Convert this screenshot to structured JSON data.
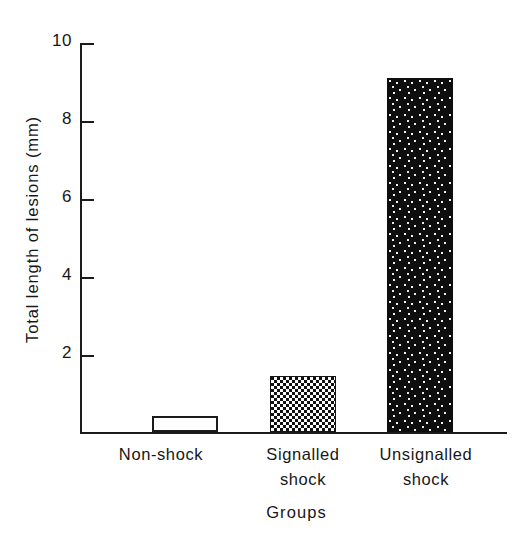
{
  "chart_data": {
    "type": "bar",
    "title": "",
    "subtitle": "",
    "xlabel": "Groups",
    "ylabel": "Total length of lesions (mm)",
    "categories": [
      "Non-shock",
      "Signalled shock",
      "Unsignalled shock"
    ],
    "category_lines": [
      [
        "Non-shock"
      ],
      [
        "Signalled",
        "shock"
      ],
      [
        "Unsignalled",
        "shock"
      ]
    ],
    "values": [
      0.4,
      1.45,
      9.1
    ],
    "ylim": [
      0,
      10
    ],
    "yticks": [
      2,
      4,
      6,
      8,
      10
    ],
    "ytick_labels": [
      "2",
      "4",
      "6",
      "8",
      "10"
    ],
    "grid": false,
    "legend": "none",
    "bar_fills": [
      "open-white",
      "checkerboard",
      "black-speckled"
    ],
    "bars": [
      {
        "label": "Non-shock",
        "value": 0.4,
        "fill": "open-white"
      },
      {
        "label": "Signalled shock",
        "value": 1.45,
        "fill": "checkerboard"
      },
      {
        "label": "Unsignalled shock",
        "value": 9.1,
        "fill": "black-speckled"
      }
    ],
    "colors": {
      "axis": "#1b1b1b",
      "text": "#171717",
      "background": "#ffffff",
      "bar_open_fill": "#ffffff",
      "bar_pattern_dark": "#111111",
      "bar_pattern_light": "#ffffff"
    }
  }
}
